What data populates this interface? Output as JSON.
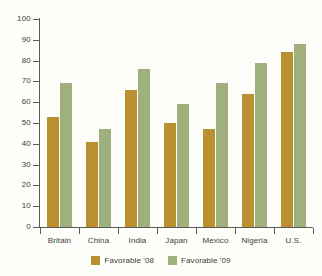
{
  "chart_data": {
    "type": "bar",
    "title": "",
    "subtitle": "",
    "xlabel": "",
    "ylabel": "",
    "ylim": [
      0,
      100
    ],
    "yticks": [
      0,
      10,
      20,
      30,
      40,
      50,
      60,
      70,
      80,
      90,
      100
    ],
    "ytick_labels": [
      "0",
      "10",
      "20",
      "30",
      "40",
      "50",
      "60",
      "70",
      "80",
      "90",
      "100"
    ],
    "grid": false,
    "legend_position": "bottom",
    "categories": [
      "Britain",
      "China",
      "India",
      "Japan",
      "Mexico",
      "Nigeria",
      "U.S."
    ],
    "series": [
      {
        "name": "Favorable '08",
        "color": "#bb9030",
        "values": [
          53,
          41,
          66,
          50,
          47,
          64,
          84
        ]
      },
      {
        "name": "Favorable '09",
        "color": "#9fb07c",
        "values": [
          69,
          47,
          76,
          59,
          69,
          79,
          88
        ]
      }
    ]
  },
  "legend": {
    "items": [
      {
        "label": "Favorable '08",
        "color": "#bb9030"
      },
      {
        "label": "Favorable '09",
        "color": "#9fb07c"
      }
    ]
  },
  "colors": {
    "series_08": "#bb9030",
    "series_09": "#9fb07c",
    "axis": "#5a5a52",
    "text": "#3d3d38",
    "background": "#fdfdfa"
  }
}
